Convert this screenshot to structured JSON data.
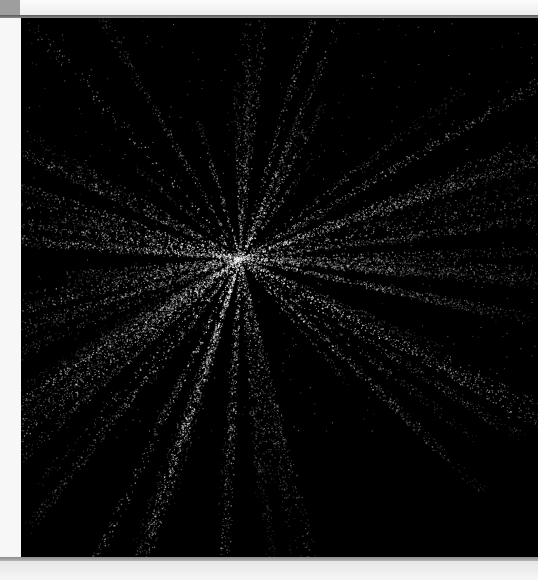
{
  "window": {
    "title": ""
  },
  "viewport": {
    "content": "particle-starburst",
    "background_color": "#000000",
    "particle_color": "#ffffff"
  },
  "chrome": {
    "corner_tab_color": "#9e9e9e",
    "frame_color": "#f4f4f4"
  }
}
